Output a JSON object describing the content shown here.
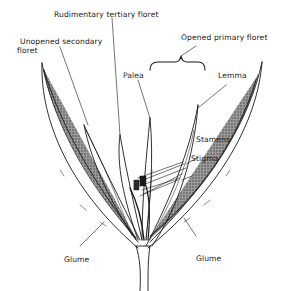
{
  "diagram": {
    "labels": {
      "rudimentary_tertiary_floret": "Rudimentary tertiary floret",
      "unopened_secondary_floret_line1": "Unopened secondary",
      "unopened_secondary_floret_line2": "floret",
      "opened_primary_floret": "Opened primary floret",
      "palea": "Palea",
      "lemma": "Lemma",
      "stamens": "Stamens",
      "stigma": "Stigma",
      "glume_left": "Glume",
      "glume_right": "Glume"
    },
    "colors": {
      "ink": "#1a1a1a",
      "background": "#ffffff",
      "stipple": "#6a6a6a"
    }
  }
}
